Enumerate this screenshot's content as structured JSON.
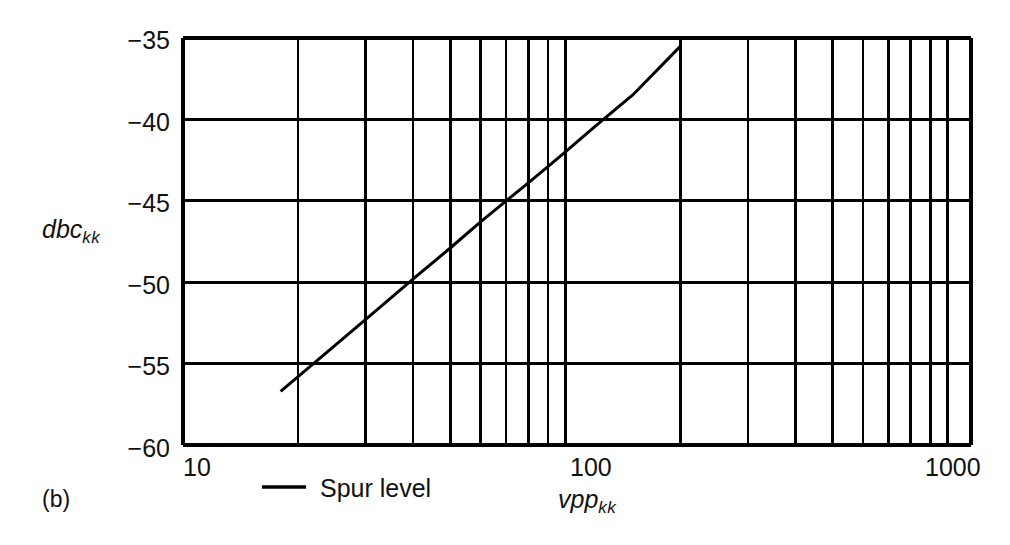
{
  "panel": {
    "label": "(b)"
  },
  "legend": {
    "entries": [
      {
        "label": "Spur level",
        "color": "#000000",
        "marker": "solid-line"
      }
    ]
  },
  "chart_data": {
    "type": "line",
    "title": "",
    "subtitle": "",
    "xlabel": "vpp_kk",
    "xlabel_base": "vpp",
    "xlabel_sub": "kk",
    "ylabel": "dbc_kk",
    "ylabel_base": "dbc",
    "ylabel_sub": "kk",
    "xscale": "log",
    "yscale": "linear",
    "xlim": [
      10,
      1150
    ],
    "ylim": [
      -60,
      -35
    ],
    "grid": true,
    "grid_color": "#000000",
    "legend_position": "below-axes-left",
    "xticks": [
      10,
      100,
      1000
    ],
    "xtick_labels": [
      "10",
      "100",
      "1000"
    ],
    "x_minor_ticks": [
      20,
      30,
      40,
      50,
      60,
      70,
      80,
      90,
      200,
      300,
      400,
      500,
      600,
      700,
      800,
      900,
      1000,
      1100
    ],
    "yticks": [
      -35,
      -40,
      -45,
      -50,
      -55,
      -60
    ],
    "ytick_labels": [
      "−35",
      "−40",
      "−45",
      "−50",
      "−55",
      "−60"
    ],
    "series": [
      {
        "name": "Spur level",
        "color": "#000000",
        "linewidth": 3,
        "x": [
          18,
          20,
          30,
          40,
          50,
          60,
          70,
          80,
          90,
          100,
          120,
          150,
          200
        ],
        "y": [
          -56.7,
          -55.8,
          -52.3,
          -49.8,
          -47.9,
          -46.3,
          -45.0,
          -43.9,
          -42.9,
          -42.0,
          -40.4,
          -38.5,
          -35.5
        ]
      }
    ],
    "annotations": []
  }
}
